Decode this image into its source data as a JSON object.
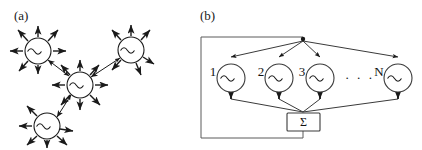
{
  "figure": {
    "background": "#ffffff",
    "stroke": "#1a1a1a",
    "panels": [
      {
        "id": "a",
        "label": "(a)",
        "caption_x": 14,
        "caption_y": 20,
        "description": "network of coupled oscillators with radiating arrows",
        "nodes": [
          {
            "name": "oscillator-top-left",
            "cx": 38,
            "cy": 51,
            "r": 13,
            "symbol": "~",
            "arrows": 7
          },
          {
            "name": "oscillator-center",
            "cx": 80,
            "cy": 85,
            "r": 13,
            "symbol": "~",
            "arrows": 8
          },
          {
            "name": "oscillator-top-right",
            "cx": 131,
            "cy": 50,
            "r": 13,
            "symbol": "~",
            "arrows": 6
          },
          {
            "name": "oscillator-bottom-left",
            "cx": 47,
            "cy": 126,
            "r": 13,
            "symbol": "~",
            "arrows": 6
          }
        ],
        "links": [
          {
            "from": "oscillator-top-left",
            "to": "oscillator-center",
            "arrow": "both"
          },
          {
            "from": "oscillator-center",
            "to": "oscillator-top-right",
            "arrow": "both"
          },
          {
            "from": "oscillator-bottom-left",
            "to": "oscillator-center",
            "arrow": "both"
          }
        ]
      },
      {
        "id": "b",
        "label": "(b)",
        "caption_x": 200,
        "caption_y": 20,
        "description": "N oscillators driven by a common feedback signal summed by a Sigma block",
        "oscillators": [
          {
            "name": "oscillator-1",
            "label": "1",
            "cx": 231,
            "cy": 78,
            "r": 14,
            "symbol": "~"
          },
          {
            "name": "oscillator-2",
            "label": "2",
            "cx": 279,
            "cy": 78,
            "r": 14,
            "symbol": "~"
          },
          {
            "name": "oscillator-3",
            "label": "3",
            "cx": 320,
            "cy": 78,
            "r": 14,
            "symbol": "~"
          },
          {
            "name": "oscillator-n",
            "label": "N",
            "cx": 398,
            "cy": 78,
            "r": 14,
            "symbol": "~"
          }
        ],
        "ellipsis": {
          "name": "ellipsis",
          "text": "· · ·",
          "x": 345,
          "y": 82
        },
        "sum_block": {
          "name": "sum-block",
          "label": "Σ",
          "x": 287,
          "y": 113,
          "w": 33,
          "h": 18
        },
        "bus": {
          "fanout_node_x": 303,
          "fanout_node_y": 40,
          "feedback_left_x": 201,
          "feedback_top_y": 37,
          "feedback_bottom_y": 138
        }
      }
    ]
  }
}
